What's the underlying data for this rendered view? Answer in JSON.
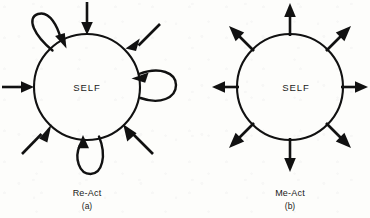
{
  "figure": {
    "background_color": "#fdfdfb",
    "ink_color": "#111111",
    "panels": [
      {
        "id": "a",
        "name": "Re-Act",
        "caption_name": "Re-Act",
        "caption_letter": "(a)",
        "center_label": "SELF",
        "circle": {
          "cx": 87,
          "cy": 87,
          "r": 53
        },
        "incoming_arrows": [
          {
            "name": "arrow-in-north",
            "angle_deg": 270,
            "direction": "inward"
          },
          {
            "name": "arrow-in-northeast",
            "angle_deg": 315,
            "direction": "inward"
          },
          {
            "name": "arrow-in-west",
            "angle_deg": 180,
            "direction": "inward"
          },
          {
            "name": "arrow-in-southwest",
            "angle_deg": 135,
            "direction": "inward"
          },
          {
            "name": "arrow-in-southeast",
            "angle_deg": 45,
            "direction": "inward"
          }
        ],
        "self_loops": [
          {
            "name": "self-loop-northwest",
            "angle_deg": 225,
            "arrowhead": "into-circle"
          },
          {
            "name": "self-loop-east",
            "angle_deg": 0,
            "arrowhead": "into-circle"
          },
          {
            "name": "self-loop-south",
            "angle_deg": 90,
            "arrowhead": "into-circle"
          }
        ]
      },
      {
        "id": "b",
        "name": "Me-Act",
        "caption_name": "Me-Act",
        "caption_letter": "(b)",
        "center_label": "SELF",
        "circle": {
          "cx": 290,
          "cy": 87,
          "r": 53
        },
        "outgoing_arrows": [
          {
            "name": "arrow-out-north",
            "angle_deg": 270,
            "direction": "outward"
          },
          {
            "name": "arrow-out-northeast",
            "angle_deg": 315,
            "direction": "outward"
          },
          {
            "name": "arrow-out-east",
            "angle_deg": 0,
            "direction": "outward"
          },
          {
            "name": "arrow-out-southeast",
            "angle_deg": 45,
            "direction": "outward"
          },
          {
            "name": "arrow-out-south",
            "angle_deg": 90,
            "direction": "outward"
          },
          {
            "name": "arrow-out-southwest",
            "angle_deg": 135,
            "direction": "outward"
          },
          {
            "name": "arrow-out-west",
            "angle_deg": 180,
            "direction": "outward"
          },
          {
            "name": "arrow-out-northwest",
            "angle_deg": 225,
            "direction": "outward"
          }
        ],
        "self_loops": []
      }
    ]
  }
}
